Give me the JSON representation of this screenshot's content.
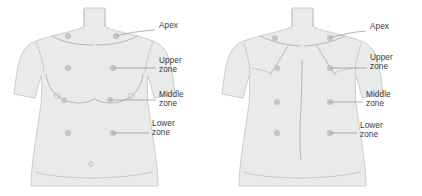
{
  "diagram": {
    "background_color": "#ffffff",
    "body_fill_color": "#e9eaea",
    "body_outline_color": "#b9bcbc",
    "marker_color": "#c4c7c7",
    "leader_color": "#8e9292",
    "text_color": "#3a3a3a"
  },
  "figures": [
    {
      "id": "anterior",
      "view_name": "anterior-chest-figure",
      "labels": [
        {
          "id": "apex",
          "text": "Apex",
          "x": 159,
          "y": 26
        },
        {
          "id": "upper",
          "text": "Upper\nzone",
          "x": 159,
          "y": 61
        },
        {
          "id": "middle",
          "text": "Middle\nzone",
          "x": 159,
          "y": 95
        },
        {
          "id": "lower",
          "text": "Lower\nzone",
          "x": 152,
          "y": 124
        }
      ],
      "markers": [
        {
          "id": "apex-left",
          "cx": 68,
          "cy": 36
        },
        {
          "id": "apex-right",
          "cx": 116,
          "cy": 36
        },
        {
          "id": "upper-left",
          "cx": 68,
          "cy": 68
        },
        {
          "id": "upper-right",
          "cx": 113,
          "cy": 68
        },
        {
          "id": "middle-left",
          "cx": 64,
          "cy": 100
        },
        {
          "id": "middle-right",
          "cx": 110,
          "cy": 100
        },
        {
          "id": "lower-left",
          "cx": 68,
          "cy": 133
        },
        {
          "id": "lower-right",
          "cx": 113,
          "cy": 133
        }
      ]
    },
    {
      "id": "posterior",
      "view_name": "posterior-chest-figure",
      "labels": [
        {
          "id": "apex",
          "text": "Apex",
          "x": 370,
          "y": 27
        },
        {
          "id": "upper",
          "text": "Upper\nzone",
          "x": 370,
          "y": 58
        },
        {
          "id": "middle",
          "text": "Middle\nzone",
          "x": 366,
          "y": 95
        },
        {
          "id": "lower",
          "text": "Lower\nzone",
          "x": 360,
          "y": 126
        }
      ],
      "markers": [
        {
          "id": "apex-left",
          "cx": 275,
          "cy": 38
        },
        {
          "id": "apex-right",
          "cx": 330,
          "cy": 38
        },
        {
          "id": "upper-left",
          "cx": 277,
          "cy": 68
        },
        {
          "id": "upper-right",
          "cx": 330,
          "cy": 68
        },
        {
          "id": "middle-left",
          "cx": 277,
          "cy": 102
        },
        {
          "id": "middle-right",
          "cx": 330,
          "cy": 102
        },
        {
          "id": "lower-left",
          "cx": 277,
          "cy": 133
        },
        {
          "id": "lower-right",
          "cx": 330,
          "cy": 133
        }
      ]
    }
  ]
}
